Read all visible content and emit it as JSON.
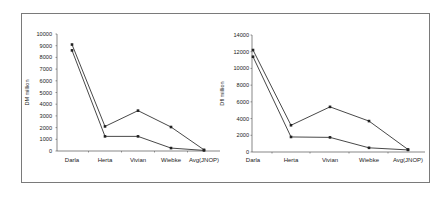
{
  "chart_data": [
    {
      "type": "line",
      "title": "",
      "xlabel": "",
      "ylabel": "DM million",
      "categories": [
        "Darla",
        "Herta",
        "Vivian",
        "Wiebke",
        "Avg(JNOP)"
      ],
      "ylim": [
        0,
        10000
      ],
      "yticks": [
        0,
        1000,
        2000,
        3000,
        4000,
        5000,
        6000,
        7000,
        8000,
        9000,
        10000
      ],
      "grid": false,
      "legend": "none",
      "series": [
        {
          "name": "Series 1",
          "values": [
            9100,
            2100,
            3450,
            2050,
            100
          ]
        },
        {
          "name": "Series 2",
          "values": [
            8600,
            1250,
            1250,
            250,
            50
          ]
        }
      ]
    },
    {
      "type": "line",
      "title": "",
      "xlabel": "",
      "ylabel": "Dfl million",
      "categories": [
        "Darla",
        "Herta",
        "Vivian",
        "Wiebke",
        "Avg(JNOP)"
      ],
      "ylim": [
        0,
        14000
      ],
      "yticks": [
        0,
        2000,
        4000,
        6000,
        8000,
        10000,
        12000,
        14000
      ],
      "grid": false,
      "legend": "none",
      "series": [
        {
          "name": "Series 1",
          "values": [
            12200,
            3200,
            5400,
            3700,
            300
          ]
        },
        {
          "name": "Series 2",
          "values": [
            11400,
            1800,
            1750,
            500,
            250
          ]
        }
      ]
    }
  ]
}
